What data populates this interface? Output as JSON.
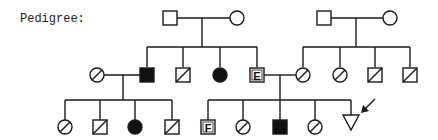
{
  "title": "Pedigree:",
  "colors": {
    "line": "#1a1a1a",
    "affected": "#111111",
    "background": "#ffffff"
  },
  "legend_symbols": {
    "square": "male",
    "circle": "female",
    "triangle": "sex unspecified",
    "filled": "affected",
    "slashed": "deceased",
    "arrow": "proband"
  },
  "generations": [
    {
      "id": "I",
      "individuals": [
        {
          "id": "I-1",
          "sex": "male",
          "status": "unaffected"
        },
        {
          "id": "I-2",
          "sex": "female",
          "status": "unaffected"
        },
        {
          "id": "I-3",
          "sex": "male",
          "status": "unaffected"
        },
        {
          "id": "I-4",
          "sex": "female",
          "status": "unaffected"
        }
      ]
    },
    {
      "id": "II",
      "individuals": [
        {
          "id": "II-1",
          "sex": "female",
          "status": "deceased",
          "note": "spouse of II-2"
        },
        {
          "id": "II-2",
          "sex": "male",
          "status": "affected"
        },
        {
          "id": "II-3",
          "sex": "male",
          "status": "deceased"
        },
        {
          "id": "II-4",
          "sex": "female",
          "status": "affected"
        },
        {
          "id": "II-5",
          "sex": "male",
          "status": "labeled",
          "label": "E"
        },
        {
          "id": "II-6",
          "sex": "female",
          "status": "deceased"
        },
        {
          "id": "II-7",
          "sex": "female",
          "status": "deceased"
        },
        {
          "id": "II-8",
          "sex": "male",
          "status": "deceased"
        },
        {
          "id": "II-9",
          "sex": "male",
          "status": "deceased"
        }
      ]
    },
    {
      "id": "III",
      "individuals": [
        {
          "id": "III-1",
          "sex": "female",
          "status": "deceased"
        },
        {
          "id": "III-2",
          "sex": "male",
          "status": "deceased"
        },
        {
          "id": "III-3",
          "sex": "female",
          "status": "affected"
        },
        {
          "id": "III-4",
          "sex": "male",
          "status": "deceased"
        },
        {
          "id": "III-5",
          "sex": "male",
          "status": "labeled",
          "label": "F"
        },
        {
          "id": "III-6",
          "sex": "female",
          "status": "deceased"
        },
        {
          "id": "III-7",
          "sex": "male",
          "status": "affected"
        },
        {
          "id": "III-8",
          "sex": "female",
          "status": "deceased"
        },
        {
          "id": "III-9",
          "sex": "unknown",
          "status": "proband",
          "symbol": "triangle"
        }
      ]
    }
  ],
  "labels": {
    "E": "E",
    "F": "F"
  }
}
